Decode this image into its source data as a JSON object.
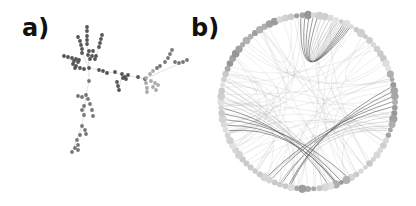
{
  "figure": {
    "panels": [
      {
        "id": "a",
        "label": "a)",
        "type": "force-directed-network"
      },
      {
        "id": "b",
        "label": "b)",
        "type": "circular-edge-bundling-network"
      }
    ]
  },
  "colors": {
    "background": "#ffffff",
    "label": "#111111",
    "node_dark": "#555555",
    "node_mid": "#777777",
    "node_light": "#aaaaaa",
    "edge": "#999999",
    "edge_strong": "#555555"
  },
  "panel_a": {
    "nodes_dark": [
      [
        87,
        27
      ],
      [
        87,
        31
      ],
      [
        87,
        36
      ],
      [
        87,
        40
      ],
      [
        87,
        44
      ],
      [
        78,
        37
      ],
      [
        80,
        41
      ],
      [
        81,
        45
      ],
      [
        82,
        49
      ],
      [
        82,
        53
      ],
      [
        102,
        35
      ],
      [
        101,
        39
      ],
      [
        100,
        43
      ],
      [
        99,
        47
      ],
      [
        89,
        51
      ],
      [
        93,
        51
      ],
      [
        88,
        55
      ],
      [
        92,
        56
      ],
      [
        96,
        56
      ],
      [
        90,
        59
      ],
      [
        95,
        59
      ],
      [
        64,
        56
      ],
      [
        68,
        57
      ],
      [
        72,
        58
      ],
      [
        76,
        59
      ],
      [
        79,
        60
      ],
      [
        74,
        61
      ],
      [
        78,
        62
      ],
      [
        73,
        64
      ],
      [
        76,
        66
      ],
      [
        80,
        68
      ],
      [
        75,
        68
      ],
      [
        84,
        69
      ],
      [
        89,
        68
      ],
      [
        99,
        70
      ],
      [
        103,
        71
      ],
      [
        107,
        73
      ],
      [
        115,
        72
      ],
      [
        122,
        74
      ],
      [
        125,
        77
      ],
      [
        128,
        75
      ],
      [
        126,
        79
      ],
      [
        123,
        78
      ],
      [
        117,
        82
      ],
      [
        118,
        86
      ],
      [
        119,
        90
      ],
      [
        138,
        77
      ],
      [
        145,
        79
      ]
    ],
    "nodes_mid": [
      [
        172,
        50
      ],
      [
        170,
        54
      ],
      [
        168,
        58
      ],
      [
        165,
        62
      ],
      [
        160,
        66
      ],
      [
        157,
        68
      ],
      [
        175,
        62
      ],
      [
        179,
        63
      ],
      [
        183,
        62
      ],
      [
        187,
        60
      ],
      [
        89,
        81
      ],
      [
        78,
        96
      ],
      [
        82,
        97
      ],
      [
        86,
        95
      ],
      [
        88,
        99
      ],
      [
        84,
        106
      ],
      [
        82,
        110
      ],
      [
        90,
        104
      ],
      [
        92,
        110
      ],
      [
        93,
        116
      ],
      [
        84,
        115
      ],
      [
        82,
        126
      ],
      [
        85,
        130
      ],
      [
        86,
        134
      ],
      [
        80,
        135
      ],
      [
        77,
        140
      ],
      [
        78,
        145
      ],
      [
        75,
        148
      ],
      [
        72,
        152
      ],
      [
        78,
        150
      ]
    ],
    "nodes_light": [
      [
        153,
        71
      ],
      [
        150,
        74
      ],
      [
        146,
        78
      ],
      [
        146,
        83
      ],
      [
        147,
        88
      ],
      [
        147,
        92
      ],
      [
        151,
        81
      ],
      [
        155,
        83
      ],
      [
        158,
        85
      ],
      [
        153,
        87
      ],
      [
        156,
        90
      ]
    ],
    "edges": [
      [
        [
          87,
          27
        ],
        [
          87,
          44
        ]
      ],
      [
        [
          87,
          44
        ],
        [
          89,
          68
        ]
      ],
      [
        [
          82,
          53
        ],
        [
          89,
          68
        ]
      ],
      [
        [
          99,
          47
        ],
        [
          96,
          56
        ]
      ],
      [
        [
          89,
          68
        ],
        [
          99,
          70
        ]
      ],
      [
        [
          99,
          70
        ],
        [
          145,
          79
        ]
      ],
      [
        [
          145,
          79
        ],
        [
          187,
          60
        ]
      ],
      [
        [
          145,
          79
        ],
        [
          147,
          92
        ]
      ],
      [
        [
          89,
          68
        ],
        [
          89,
          81
        ]
      ],
      [
        [
          89,
          81
        ],
        [
          86,
          95
        ]
      ],
      [
        [
          86,
          95
        ],
        [
          84,
          115
        ]
      ],
      [
        [
          84,
          115
        ],
        [
          82,
          126
        ]
      ],
      [
        [
          82,
          126
        ],
        [
          72,
          152
        ]
      ],
      [
        [
          64,
          56
        ],
        [
          80,
          68
        ]
      ],
      [
        [
          122,
          74
        ],
        [
          119,
          90
        ]
      ]
    ]
  },
  "panel_b": {
    "center": [
      308,
      102
    ],
    "radius": 87,
    "node_count": 96,
    "bundles": [
      {
        "name": "top-loop",
        "from_deg": [
          -95,
          -70
        ],
        "to_deg": [
          -95,
          -70
        ],
        "via": [
          306,
          70
        ],
        "strength": "strong"
      },
      {
        "name": "left-fan",
        "from_deg": [
          160,
          195
        ],
        "to_deg": [
          60,
          80
        ],
        "via": [
          290,
          125
        ],
        "strength": "strong"
      },
      {
        "name": "right-fan",
        "from_deg": [
          -10,
          20
        ],
        "to_deg": [
          100,
          120
        ],
        "via": [
          320,
          125
        ],
        "strength": "strong"
      }
    ]
  }
}
